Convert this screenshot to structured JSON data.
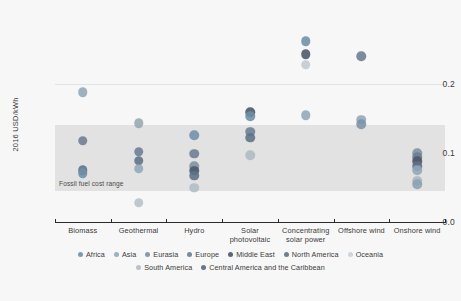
{
  "chart_data": {
    "type": "scatter",
    "title": "",
    "xlabel": "",
    "ylabel": "2016 USD/kWh",
    "ylim": [
      0.0,
      0.27
    ],
    "yticks": [
      "0.0",
      "0.1",
      "0.2"
    ],
    "ytick_values": [
      0.0,
      0.1,
      0.2
    ],
    "grid": true,
    "legend_position": "bottom",
    "categories": [
      "Biomass",
      "Geothermal",
      "Hydro",
      "Solar\nphotovoltaic",
      "Concentrating\nsolar power",
      "Offshore wind",
      "Onshore wind"
    ],
    "annotations": [
      {
        "text": "Fossil fuel cost range",
        "band_min": 0.045,
        "band_max": 0.14,
        "color": "#b4b4b4"
      }
    ],
    "series": [
      {
        "name": "Africa",
        "color": "#6e8fa8"
      },
      {
        "name": "Asia",
        "color": "#8fa8b8"
      },
      {
        "name": "Eurasia",
        "color": "#7e8fa0"
      },
      {
        "name": "Europe",
        "color": "#6b7d92"
      },
      {
        "name": "Middle East",
        "color": "#4a5668"
      },
      {
        "name": "North America",
        "color": "#5e7186"
      },
      {
        "name": "Oceania",
        "color": "#c9cfd4"
      },
      {
        "name": "South America",
        "color": "#b0bcc6"
      },
      {
        "name": "Central America and the Caribbean",
        "color": "#58687c"
      }
    ],
    "points": [
      {
        "category": "Biomass",
        "series": "Asia",
        "value": 0.188,
        "color": "#8fa8b8"
      },
      {
        "category": "Biomass",
        "series": "Europe",
        "value": 0.118,
        "color": "#6b7d92"
      },
      {
        "category": "Biomass",
        "series": "North America",
        "value": 0.075,
        "color": "#5e7186"
      },
      {
        "category": "Biomass",
        "series": "Africa",
        "value": 0.071,
        "color": "#6e8fa8"
      },
      {
        "category": "Geothermal",
        "series": "Oceania",
        "value": 0.143,
        "color": "#9aa7b0"
      },
      {
        "category": "Geothermal",
        "series": "Europe",
        "value": 0.102,
        "color": "#6b7d92"
      },
      {
        "category": "Geothermal",
        "series": "North America",
        "value": 0.089,
        "color": "#5e7186"
      },
      {
        "category": "Geothermal",
        "series": "Asia",
        "value": 0.077,
        "color": "#8fa8b8"
      },
      {
        "category": "Geothermal",
        "series": "South America",
        "value": 0.028,
        "color": "#b6c2ca"
      },
      {
        "category": "Hydro",
        "series": "Africa",
        "value": 0.126,
        "color": "#6e8fa8"
      },
      {
        "category": "Hydro",
        "series": "Europe",
        "value": 0.099,
        "color": "#6b7d92"
      },
      {
        "category": "Hydro",
        "series": "Eurasia",
        "value": 0.081,
        "color": "#7e8fa0"
      },
      {
        "category": "Hydro",
        "series": "Middle East",
        "value": 0.074,
        "color": "#4a5668"
      },
      {
        "category": "Hydro",
        "series": "North America",
        "value": 0.067,
        "color": "#5e7186"
      },
      {
        "category": "Hydro",
        "series": "South America",
        "value": 0.05,
        "color": "#b0bcc6"
      },
      {
        "category": "Solar\nphotovoltaic",
        "series": "Middle East",
        "value": 0.159,
        "color": "#4a5668"
      },
      {
        "category": "Solar\nphotovoltaic",
        "series": "Africa",
        "value": 0.153,
        "color": "#6e8fa8"
      },
      {
        "category": "Solar\nphotovoltaic",
        "series": "Europe",
        "value": 0.131,
        "color": "#6b7d92"
      },
      {
        "category": "Solar\nphotovoltaic",
        "series": "North America",
        "value": 0.122,
        "color": "#5e7186"
      },
      {
        "category": "Solar\nphotovoltaic",
        "series": "Oceania",
        "value": 0.097,
        "color": "#aeb9c2"
      },
      {
        "category": "Concentrating\nsolar power",
        "series": "Africa",
        "value": 0.262,
        "color": "#6e8fa8"
      },
      {
        "category": "Concentrating\nsolar power",
        "series": "Middle East",
        "value": 0.243,
        "color": "#4a5668"
      },
      {
        "category": "Concentrating\nsolar power",
        "series": "Oceania",
        "value": 0.228,
        "color": "#c2cad1"
      },
      {
        "category": "Concentrating\nsolar power",
        "series": "Asia",
        "value": 0.155,
        "color": "#8fa8b8"
      },
      {
        "category": "Offshore wind",
        "series": "Europe",
        "value": 0.24,
        "color": "#6b7d92"
      },
      {
        "category": "Offshore wind",
        "series": "Asia",
        "value": 0.148,
        "color": "#8fa8b8"
      },
      {
        "category": "Offshore wind",
        "series": "Africa",
        "value": 0.142,
        "color": "#7b93a8"
      },
      {
        "category": "Onshore wind",
        "series": "Eurasia",
        "value": 0.1,
        "color": "#7e8fa0"
      },
      {
        "category": "Onshore wind",
        "series": "Europe",
        "value": 0.094,
        "color": "#6b7d92"
      },
      {
        "category": "Onshore wind",
        "series": "Middle East",
        "value": 0.088,
        "color": "#4a5668"
      },
      {
        "category": "Onshore wind",
        "series": "North America",
        "value": 0.081,
        "color": "#5e7186"
      },
      {
        "category": "Onshore wind",
        "series": "Asia",
        "value": 0.075,
        "color": "#8fa8b8"
      },
      {
        "category": "Onshore wind",
        "series": "South America",
        "value": 0.06,
        "color": "#a8b5bf"
      },
      {
        "category": "Onshore wind",
        "series": "Africa",
        "value": 0.055,
        "color": "#8ba0b2"
      }
    ]
  }
}
